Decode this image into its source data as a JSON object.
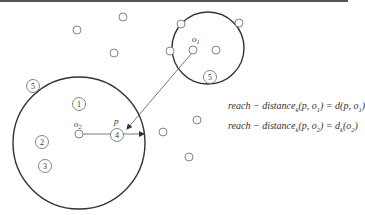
{
  "diagram": {
    "colors": {
      "stroke": "#333333",
      "text": "#333333",
      "topbar": "#555555"
    },
    "labels": {
      "o1": "o",
      "o1_sub": "1",
      "o2": "o",
      "o2_sub": "2",
      "p": "p",
      "n1": "1",
      "n2": "2",
      "n3": "3",
      "n4": "4",
      "n5_left": "5",
      "n5_right": "5"
    },
    "formulas": [
      {
        "lhs": "reach − distance",
        "k": "k",
        "args": "(p, o",
        "arg_sub": "1",
        "close": ")",
        "eq": " = d(p, o",
        "rhs_sub": "1",
        "rhs_close": ")"
      },
      {
        "lhs": "reach − distance",
        "k": "k",
        "args": "(p, o",
        "arg_sub": "2",
        "close": ")",
        "eq": " = d",
        "rhs_k": "k",
        "rhs_open": "(o",
        "rhs_sub": "2",
        "rhs_close": ")"
      }
    ]
  }
}
